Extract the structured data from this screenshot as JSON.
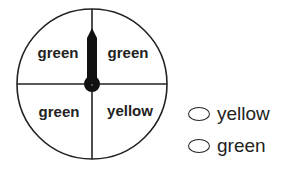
{
  "spinner": {
    "sections": [
      {
        "position": "top-left",
        "label": "green"
      },
      {
        "position": "top-right",
        "label": "green"
      },
      {
        "position": "bottom-left",
        "label": "green"
      },
      {
        "position": "bottom-right",
        "label": "yellow"
      }
    ],
    "pointer_direction": "up",
    "colors": {
      "stroke": "#222222",
      "pointer": "#111111",
      "background": "#ffffff"
    }
  },
  "answer_options": [
    {
      "label": "yellow"
    },
    {
      "label": "green"
    }
  ]
}
